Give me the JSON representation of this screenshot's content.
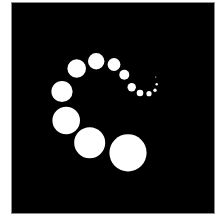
{
  "image": {
    "description": "Spiral of white dots decreasing in size on a black square",
    "background_color": "#ffffff",
    "panel_color": "#000000",
    "dot_color": "#ffffff"
  },
  "panel": {
    "x": 12,
    "y": 3,
    "width": 202,
    "height": 210
  },
  "dots": [
    {
      "cx": 128.0,
      "cy": 152.8,
      "r": 18.6
    },
    {
      "cx": 89.7,
      "cy": 142.8,
      "r": 15.5
    },
    {
      "cx": 66.2,
      "cy": 120.5,
      "r": 13.8
    },
    {
      "cx": 62.0,
      "cy": 91.5,
      "r": 10.6
    },
    {
      "cx": 76.7,
      "cy": 68.5,
      "r": 9.3
    },
    {
      "cx": 96.2,
      "cy": 61.2,
      "r": 8.2
    },
    {
      "cx": 114.0,
      "cy": 64.5,
      "r": 6.4
    },
    {
      "cx": 124.3,
      "cy": 74.7,
      "r": 5.0
    },
    {
      "cx": 131.7,
      "cy": 87.3,
      "r": 4.2
    },
    {
      "cx": 140.0,
      "cy": 93.0,
      "r": 3.3
    },
    {
      "cx": 149.0,
      "cy": 93.7,
      "r": 2.6
    },
    {
      "cx": 155.0,
      "cy": 90.3,
      "r": 1.7
    },
    {
      "cx": 156.7,
      "cy": 84.3,
      "r": 1.2
    },
    {
      "cx": 155.7,
      "cy": 77.0,
      "r": 0.6
    }
  ]
}
